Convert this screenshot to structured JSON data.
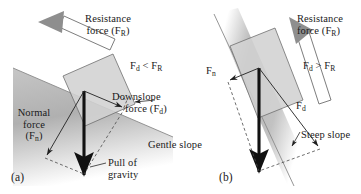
{
  "figure": {
    "caption_a": "(a)",
    "caption_b": "(b)"
  },
  "panel_a": {
    "name": "gentle-slope-panel",
    "resistance_label_line1": "Resistance",
    "resistance_label_line2_pre": "force (F",
    "resistance_label_line2_sub": "R",
    "resistance_label_line2_post": ")",
    "comparison_pre": "F",
    "comparison_sub1": "d",
    "comparison_op": " < F",
    "comparison_sub2": "R",
    "downslope_line1": "Downslope",
    "downslope_line2_pre": "force (F",
    "downslope_line2_sub": "d",
    "downslope_line2_post": ")",
    "normal_line1": "Normal",
    "normal_line2": "force",
    "normal_line3_pre": "(F",
    "normal_line3_sub": "n",
    "normal_line3_post": ")",
    "gravity_line1": "Pull of",
    "gravity_line2": "gravity",
    "slope_label": "Gentle slope"
  },
  "panel_b": {
    "name": "steep-slope-panel",
    "resistance_label_line1": "Resistance",
    "resistance_label_line2_pre": "force (F",
    "resistance_label_line2_sub": "R",
    "resistance_label_line2_post": ")",
    "comparison_pre": "F",
    "comparison_sub1": "d",
    "comparison_op": " > F",
    "comparison_sub2": "R",
    "normal_pre": "F",
    "normal_sub": "n",
    "downslope_pre": "F",
    "downslope_sub": "d",
    "slope_label": "Steep slope"
  },
  "colors": {
    "slope_fill": "#b9b9b9",
    "block_fill": "#cfcfcf",
    "gravity_arrow": "#111111",
    "resistance_arrow": "#8e8e8e",
    "text": "#1a1a1a",
    "outline": "#4a4a4a"
  }
}
